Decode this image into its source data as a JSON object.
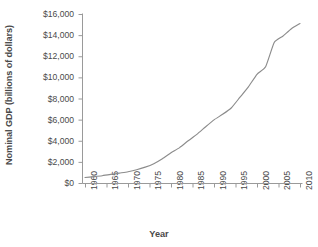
{
  "chart_data": {
    "type": "line",
    "title": "",
    "xlabel": "Year",
    "ylabel": "Nominal GDP (billions of dollars)",
    "xlim": [
      1960,
      2010
    ],
    "ylim": [
      0,
      16000
    ],
    "grid": false,
    "legend": "none",
    "line_color": "#8c8c8c",
    "x_tick_labels": [
      "1960",
      "1965",
      "1970",
      "1975",
      "1980",
      "1985",
      "1990",
      "1995",
      "2000",
      "2005",
      "2010"
    ],
    "y_tick_labels": [
      "$0",
      "$2,000",
      "$4,000",
      "$6,000",
      "$8,000",
      "$10,000",
      "$12,000",
      "$14,000",
      "$16,000"
    ],
    "y_tick_values": [
      0,
      2000,
      4000,
      6000,
      8000,
      10000,
      12000,
      14000,
      16000
    ],
    "x": [
      1960,
      1962,
      1964,
      1966,
      1968,
      1970,
      1972,
      1974,
      1976,
      1978,
      1980,
      1982,
      1984,
      1986,
      1988,
      1990,
      1992,
      1994,
      1996,
      1998,
      2000,
      2002,
      2004,
      2006,
      2008,
      2010
    ],
    "values": [
      520,
      600,
      690,
      810,
      940,
      1070,
      1250,
      1500,
      1830,
      2300,
      2860,
      3350,
      4000,
      4600,
      5300,
      5980,
      6500,
      7100,
      8100,
      9100,
      10290,
      11000,
      13300,
      13900,
      14600,
      15100
    ],
    "series": [
      {
        "name": "Nominal GDP",
        "values": [
          520,
          600,
          690,
          810,
          940,
          1070,
          1250,
          1500,
          1830,
          2300,
          2860,
          3350,
          4000,
          4600,
          5300,
          5980,
          6500,
          7100,
          8100,
          9100,
          10290,
          11000,
          13300,
          13900,
          14600,
          15100
        ]
      }
    ]
  },
  "axes": {
    "y_title": "Nominal GDP (billions of dollars)",
    "x_title": "Year"
  }
}
